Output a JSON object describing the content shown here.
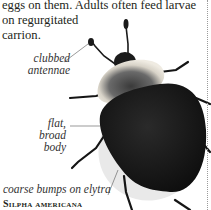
{
  "article": {
    "body_lines": [
      "eggs on them. Adults often feed larvae",
      "on regurgitated",
      "carrion."
    ]
  },
  "illustration": {
    "subject": "carrion beetle",
    "labels": {
      "antennae": [
        "clubbed",
        "antennae"
      ],
      "body": [
        "flat, broad",
        "body"
      ],
      "elytra": "coarse bumps on elytra"
    },
    "caption": "Silpha americana"
  }
}
